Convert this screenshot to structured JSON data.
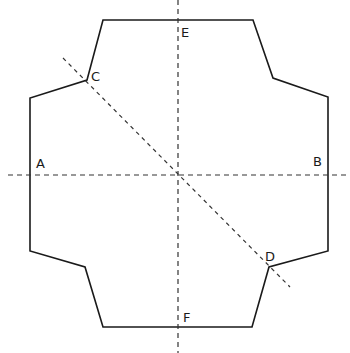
{
  "diagram": {
    "type": "geometric-net",
    "colors": {
      "outline": "#1a1a1a",
      "dashed": "#333333",
      "background": "#ffffff"
    },
    "outline_points": "103,20 253,20 273,78 328,97 328,251 269,267 252,327 103,327 85,267 30,251 30,98 87,80",
    "axes": {
      "vertical": {
        "x1": 178,
        "y1": 0,
        "x2": 178,
        "y2": 353
      },
      "horizontal": {
        "x1": 8,
        "y1": 175,
        "x2": 350,
        "y2": 175
      },
      "diagonal": {
        "x1": 63,
        "y1": 58,
        "x2": 290,
        "y2": 287
      }
    },
    "labels": [
      {
        "id": "A",
        "text": "A",
        "x": 36,
        "y": 157
      },
      {
        "id": "B",
        "text": "B",
        "x": 313,
        "y": 155
      },
      {
        "id": "C",
        "text": "C",
        "x": 91,
        "y": 70
      },
      {
        "id": "D",
        "text": "D",
        "x": 265,
        "y": 250
      },
      {
        "id": "E",
        "text": "E",
        "x": 181,
        "y": 26
      },
      {
        "id": "F",
        "text": "F",
        "x": 183,
        "y": 311
      }
    ]
  }
}
